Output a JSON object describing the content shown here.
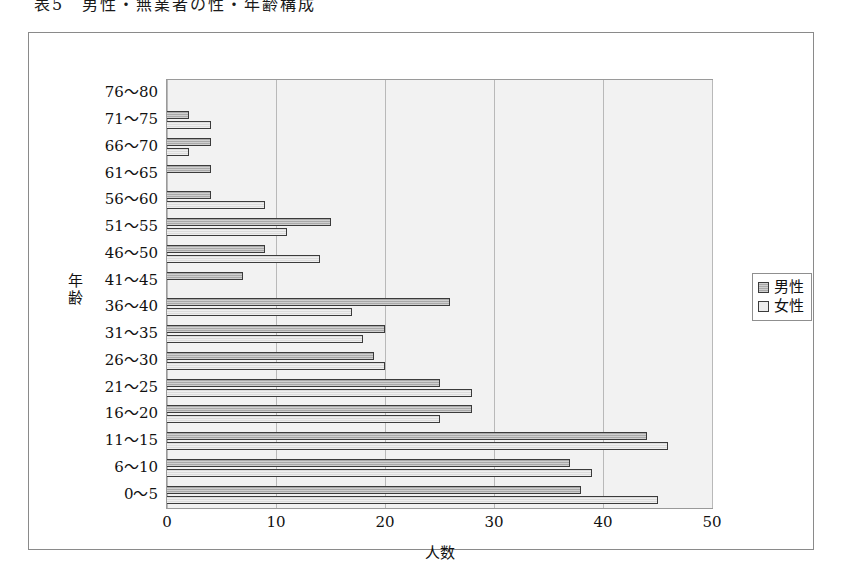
{
  "caption": "表5　男性・無業者の性・年齢構成",
  "legend": {
    "position": "right",
    "entries": [
      {
        "label": "男性",
        "color": "#a9a9a9",
        "key": "male"
      },
      {
        "label": "女性",
        "color": "#ececec",
        "key": "female"
      }
    ]
  },
  "axes": {
    "y_title": "年齢",
    "y_title_chars": [
      "年",
      "齢"
    ],
    "x_title": "人数",
    "x_ticks": [
      "0",
      "10",
      "20",
      "30",
      "40",
      "50"
    ]
  },
  "chart_data": {
    "type": "bar",
    "orientation": "horizontal",
    "title": "表5　男性・無業者の性・年齢構成",
    "xlabel": "人数",
    "ylabel": "年齢",
    "xlim": [
      0,
      50
    ],
    "xticks": [
      0,
      10,
      20,
      30,
      40,
      50
    ],
    "grid": true,
    "legend_position": "right",
    "categories": [
      "76～80",
      "71～75",
      "66～70",
      "61～65",
      "56～60",
      "51～55",
      "46～50",
      "41～45",
      "36～40",
      "31～35",
      "26～30",
      "21～25",
      "16～20",
      "11～15",
      "6～10",
      "0～5"
    ],
    "series": [
      {
        "name": "男性",
        "color": "#a9a9a9",
        "values": [
          0,
          2,
          4,
          4,
          4,
          15,
          9,
          7,
          26,
          20,
          19,
          25,
          28,
          44,
          37,
          38
        ]
      },
      {
        "name": "女性",
        "color": "#ececec",
        "values": [
          0,
          4,
          2,
          0,
          9,
          11,
          14,
          0,
          17,
          18,
          20,
          28,
          25,
          46,
          39,
          45
        ]
      }
    ]
  }
}
